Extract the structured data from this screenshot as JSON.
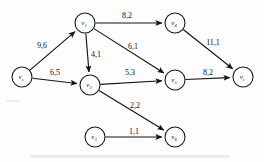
{
  "diagram": {
    "type": "network-flow-graph",
    "label_format": "capacity,flow",
    "nodes": [
      {
        "id": "vs",
        "base": "v",
        "sub": "s",
        "cx": 22,
        "cy": 77,
        "r": 10
      },
      {
        "id": "v1",
        "base": "v",
        "sub": "1",
        "cx": 85,
        "cy": 23,
        "r": 10
      },
      {
        "id": "v2",
        "base": "v",
        "sub": "2",
        "cx": 90,
        "cy": 85,
        "r": 10
      },
      {
        "id": "v3",
        "base": "v",
        "sub": "3",
        "cx": 95,
        "cy": 137,
        "r": 10
      },
      {
        "id": "v4",
        "base": "v",
        "sub": "4",
        "cx": 175,
        "cy": 23,
        "r": 10
      },
      {
        "id": "v5",
        "base": "v",
        "sub": "5",
        "cx": 175,
        "cy": 80,
        "r": 10
      },
      {
        "id": "v6",
        "base": "v",
        "sub": "6",
        "cx": 175,
        "cy": 137,
        "r": 10
      },
      {
        "id": "vt",
        "base": "v",
        "sub": "t",
        "cx": 243,
        "cy": 77,
        "r": 10
      }
    ],
    "edges": [
      {
        "id": "vs-v1",
        "from": "vs",
        "to": "v1",
        "label": "9,6",
        "lx": 42,
        "ly": 45
      },
      {
        "id": "vs-v2",
        "from": "vs",
        "to": "v2",
        "label": "6,5",
        "lx": 55,
        "ly": 72
      },
      {
        "id": "v1-v2",
        "from": "v1",
        "to": "v2",
        "label": "4,1",
        "lx": 96,
        "ly": 54
      },
      {
        "id": "v1-v4",
        "from": "v1",
        "to": "v4",
        "label": "8,2",
        "lx": 127,
        "ly": 15
      },
      {
        "id": "v1-v5",
        "from": "v1",
        "to": "v5",
        "label": "6,1",
        "lx": 133,
        "ly": 46
      },
      {
        "id": "v2-v5",
        "from": "v2",
        "to": "v5",
        "label": "5,3",
        "lx": 130,
        "ly": 72
      },
      {
        "id": "v2-v6",
        "from": "v2",
        "to": "v6",
        "label": "2,2",
        "lx": 135,
        "ly": 105
      },
      {
        "id": "v3-v6",
        "from": "v3",
        "to": "v6",
        "label": "1,1",
        "lx": 134,
        "ly": 131
      },
      {
        "id": "v4-vt",
        "from": "v4",
        "to": "vt",
        "label": "11,1",
        "lx": 213,
        "ly": 42
      },
      {
        "id": "v5-vt",
        "from": "v5",
        "to": "vt",
        "label": "8,2",
        "lx": 208,
        "ly": 72
      }
    ]
  }
}
